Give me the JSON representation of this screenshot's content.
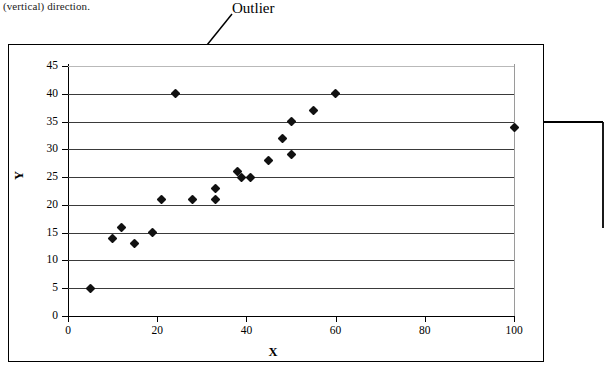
{
  "document": {
    "text_fragment": "(vertical) direction."
  },
  "annotations": {
    "outlier_label": "Outlier",
    "outlier_arrow": "arrow-pointing-down-left",
    "right_arrow": "arrow-pointing-left"
  },
  "chart_data": {
    "type": "scatter",
    "title": "",
    "xlabel": "X",
    "ylabel": "Y",
    "xlim": [
      0,
      100
    ],
    "ylim": [
      0,
      45
    ],
    "xticks": [
      0,
      20,
      40,
      60,
      80,
      100
    ],
    "yticks": [
      0,
      5,
      10,
      15,
      20,
      25,
      30,
      35,
      40,
      45
    ],
    "grid": "horizontal",
    "legend": "none",
    "marker": "diamond",
    "marker_color": "#111111",
    "points": [
      {
        "x": 5,
        "y": 5
      },
      {
        "x": 10,
        "y": 14
      },
      {
        "x": 12,
        "y": 16
      },
      {
        "x": 15,
        "y": 13
      },
      {
        "x": 19,
        "y": 15
      },
      {
        "x": 21,
        "y": 21
      },
      {
        "x": 24,
        "y": 40
      },
      {
        "x": 28,
        "y": 21
      },
      {
        "x": 33,
        "y": 23
      },
      {
        "x": 33,
        "y": 21
      },
      {
        "x": 38,
        "y": 26
      },
      {
        "x": 39,
        "y": 25
      },
      {
        "x": 41,
        "y": 25
      },
      {
        "x": 45,
        "y": 28
      },
      {
        "x": 48,
        "y": 32
      },
      {
        "x": 50,
        "y": 35
      },
      {
        "x": 50,
        "y": 29
      },
      {
        "x": 55,
        "y": 37
      },
      {
        "x": 60,
        "y": 40
      },
      {
        "x": 100,
        "y": 34
      }
    ],
    "annotated_points": [
      {
        "x": 24,
        "y": 40,
        "label": "Outlier"
      },
      {
        "x": 100,
        "y": 34,
        "label": ""
      }
    ]
  }
}
